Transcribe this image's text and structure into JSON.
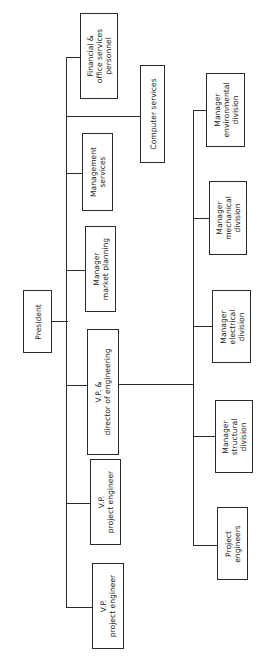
{
  "chart": {
    "type": "org-chart",
    "orientation": "rotated-90-ccw",
    "root": "President",
    "level1": [
      {
        "id": "vp1",
        "label": "V.P.\nproject engineer"
      },
      {
        "id": "vp2",
        "label": "V.P.\nproject engineer"
      },
      {
        "id": "vpdir",
        "label": "V.P. &\ndirector of engineering"
      },
      {
        "id": "mkt",
        "label": "Manager\nmarket planning"
      },
      {
        "id": "mgmt",
        "label": "Management\nservices"
      },
      {
        "id": "comp",
        "label": "Computer services"
      },
      {
        "id": "fin",
        "label": "Financial &\noffice services\npersonnel"
      }
    ],
    "level2_under_vp_director": [
      {
        "id": "pe",
        "label": "Project\nengineers"
      },
      {
        "id": "struct",
        "label": "Manager\nstructural\ndivision"
      },
      {
        "id": "elec",
        "label": "Manager\nelectrical\ndivision"
      },
      {
        "id": "mech",
        "label": "Manager\nmechanical\ndivision"
      },
      {
        "id": "env",
        "label": "Manager\nenvironmental\ndivision"
      }
    ]
  }
}
